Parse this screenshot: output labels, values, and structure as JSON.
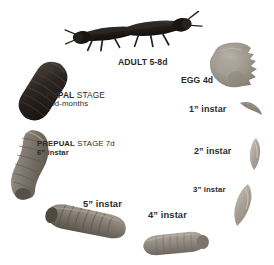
{
  "diagram": {
    "background_color": "#ffffff",
    "text_color": "#2b2b2b"
  },
  "stages": [
    {
      "id": "adult",
      "name": "adult-fly-pair",
      "label_line1": "ADULT  5-8d",
      "stage_name": "ADULT",
      "duration": "5-8d",
      "specimen": "two-dark-adult-flies",
      "color": "#241f1d"
    },
    {
      "id": "egg",
      "name": "egg-mass",
      "label_line1": "EGG  4d",
      "stage_name": "EGG",
      "duration": "4d",
      "specimen": "tan-gray-egg-mass-blob",
      "color": "#9a9287"
    },
    {
      "id": "instar1",
      "name": "first-instar-larva",
      "label_line1": "1” instar",
      "stage_name": "1” instar",
      "specimen": "tiny-pale-curved-larva",
      "color": "#a79e92"
    },
    {
      "id": "instar2",
      "name": "second-instar-larva",
      "label_line1": "2” instar",
      "stage_name": "2” instar",
      "specimen": "small-pale-larva",
      "color": "#b4ab9f"
    },
    {
      "id": "instar3",
      "name": "third-instar-larva",
      "label_line1": "3” instar",
      "stage_name": "3” instar",
      "specimen": "pale-gray-larva",
      "color": "#b0a79b"
    },
    {
      "id": "instar4",
      "name": "fourth-instar-larva",
      "label_line1": "4” instar",
      "stage_name": "4” instar",
      "specimen": "gray-segmented-larva",
      "color": "#8d8madj"
    },
    {
      "id": "instar5",
      "name": "fifth-instar-larva",
      "label_line1": "5” instar",
      "stage_name": "5” instar",
      "specimen": "large-gray-brown-segmented-larva",
      "color": "#7b746a"
    },
    {
      "id": "prepupal",
      "name": "prepupal-stage",
      "label_line1_strong": "PREPUAL",
      "label_line1_light": "STAGE 7d",
      "label_line2": "6”  instar",
      "stage_name": "PREPUAL STAGE",
      "duration": "7d",
      "specimen": "curved-gray-segmented-prepupa",
      "color": "#837c72"
    },
    {
      "id": "pupal",
      "name": "pupal-stage",
      "label_line1_strong": "PUPAL",
      "label_line1_light": "STAGE",
      "label_line2": "10d-months",
      "stage_name": "PUPAL STAGE",
      "duration": "10d-months",
      "specimen": "dark-brown-black-pupal-case",
      "color": "#2e2723"
    }
  ]
}
